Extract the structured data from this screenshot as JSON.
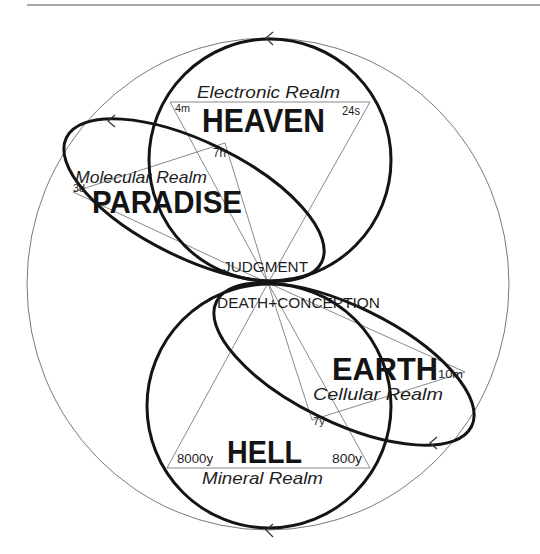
{
  "heaven": {
    "title": "HEAVEN",
    "realm": "Electronic Realm",
    "left_time": "4m",
    "right_time": "24s"
  },
  "paradise": {
    "title": "PARADISE",
    "realm": "Molecular Realm",
    "outer_time": "3d",
    "inner_time": "7h"
  },
  "earth": {
    "title": "EARTH",
    "realm": "Cellular Realm",
    "outer_time": "10m",
    "inner_time": "7y"
  },
  "hell": {
    "title": "HELL",
    "realm": "Mineral Realm",
    "left_time": "8000y",
    "right_time": "800y"
  },
  "center": {
    "upper": "JUDGMENT",
    "lower": "DEATH+CONCEPTION"
  },
  "icons": {
    "flow_arrows": [
      "arrow-left-icon",
      "arrow-left-icon",
      "arrow-left-icon",
      "arrow-left-icon"
    ]
  },
  "colors": {
    "ink": "#141414",
    "thin_line": "#6b6b6b",
    "outer_circle": "#7a7a7a",
    "background": "#ffffff"
  }
}
